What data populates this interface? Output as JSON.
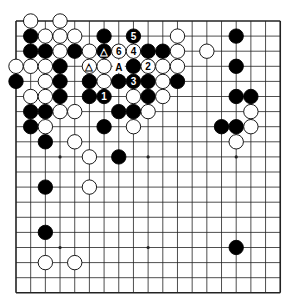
{
  "diagram": {
    "type": "go-board",
    "size": 19,
    "visible_rows": 19,
    "geometry": {
      "left": 16,
      "top": 21,
      "dx": 14.68,
      "dy": 15.1,
      "stone_radius": 7.2
    },
    "colors": {
      "line": "#222222",
      "black": "#000000",
      "white": "#ffffff",
      "background": "#ffffff"
    },
    "hoshi": [
      [
        3,
        3
      ],
      [
        9,
        3
      ],
      [
        15,
        3
      ],
      [
        3,
        9
      ],
      [
        9,
        9
      ],
      [
        15,
        9
      ],
      [
        3,
        15
      ],
      [
        9,
        15
      ],
      [
        15,
        15
      ]
    ],
    "stones": [
      {
        "c": 1,
        "r": 0,
        "color": "white"
      },
      {
        "c": 3,
        "r": 0,
        "color": "white"
      },
      {
        "c": 1,
        "r": 1,
        "color": "black"
      },
      {
        "c": 2,
        "r": 1,
        "color": "white"
      },
      {
        "c": 3,
        "r": 1,
        "color": "white"
      },
      {
        "c": 4,
        "r": 1,
        "color": "white"
      },
      {
        "c": 6,
        "r": 1,
        "color": "black"
      },
      {
        "c": 8,
        "r": 1,
        "color": "black",
        "label": "5"
      },
      {
        "c": 11,
        "r": 1,
        "color": "white"
      },
      {
        "c": 15,
        "r": 1,
        "color": "black"
      },
      {
        "c": 1,
        "r": 2,
        "color": "black"
      },
      {
        "c": 2,
        "r": 2,
        "color": "black"
      },
      {
        "c": 3,
        "r": 2,
        "color": "white"
      },
      {
        "c": 4,
        "r": 2,
        "color": "black"
      },
      {
        "c": 5,
        "r": 2,
        "color": "white"
      },
      {
        "c": 6,
        "r": 2,
        "color": "black",
        "label": "△"
      },
      {
        "c": 7,
        "r": 2,
        "color": "white",
        "label": "6"
      },
      {
        "c": 8,
        "r": 2,
        "color": "white",
        "label": "4"
      },
      {
        "c": 9,
        "r": 2,
        "color": "black"
      },
      {
        "c": 10,
        "r": 2,
        "color": "black"
      },
      {
        "c": 11,
        "r": 2,
        "color": "white"
      },
      {
        "c": 13,
        "r": 2,
        "color": "white"
      },
      {
        "c": 0,
        "r": 3,
        "color": "white"
      },
      {
        "c": 1,
        "r": 3,
        "color": "white"
      },
      {
        "c": 2,
        "r": 3,
        "color": "white"
      },
      {
        "c": 3,
        "r": 3,
        "color": "black"
      },
      {
        "c": 5,
        "r": 3,
        "color": "white",
        "label": "△"
      },
      {
        "c": 6,
        "r": 3,
        "color": "white"
      },
      {
        "c": 8,
        "r": 3,
        "color": "black"
      },
      {
        "c": 9,
        "r": 3,
        "color": "white",
        "label": "2"
      },
      {
        "c": 10,
        "r": 3,
        "color": "white"
      },
      {
        "c": 11,
        "r": 3,
        "color": "white"
      },
      {
        "c": 15,
        "r": 3,
        "color": "black"
      },
      {
        "c": 0,
        "r": 4,
        "color": "black"
      },
      {
        "c": 2,
        "r": 4,
        "color": "white"
      },
      {
        "c": 3,
        "r": 4,
        "color": "black"
      },
      {
        "c": 5,
        "r": 4,
        "color": "black"
      },
      {
        "c": 6,
        "r": 4,
        "color": "white"
      },
      {
        "c": 7,
        "r": 4,
        "color": "black"
      },
      {
        "c": 8,
        "r": 4,
        "color": "black",
        "label": "3"
      },
      {
        "c": 9,
        "r": 4,
        "color": "black"
      },
      {
        "c": 10,
        "r": 4,
        "color": "white"
      },
      {
        "c": 11,
        "r": 4,
        "color": "black"
      },
      {
        "c": 1,
        "r": 5,
        "color": "white"
      },
      {
        "c": 2,
        "r": 5,
        "color": "white"
      },
      {
        "c": 3,
        "r": 5,
        "color": "black"
      },
      {
        "c": 5,
        "r": 5,
        "color": "black"
      },
      {
        "c": 6,
        "r": 5,
        "color": "black",
        "label": "1"
      },
      {
        "c": 8,
        "r": 5,
        "color": "white"
      },
      {
        "c": 9,
        "r": 5,
        "color": "black"
      },
      {
        "c": 10,
        "r": 5,
        "color": "white"
      },
      {
        "c": 15,
        "r": 5,
        "color": "black"
      },
      {
        "c": 16,
        "r": 5,
        "color": "black"
      },
      {
        "c": 1,
        "r": 6,
        "color": "black"
      },
      {
        "c": 2,
        "r": 6,
        "color": "black"
      },
      {
        "c": 3,
        "r": 6,
        "color": "white"
      },
      {
        "c": 4,
        "r": 6,
        "color": "white"
      },
      {
        "c": 7,
        "r": 6,
        "color": "black"
      },
      {
        "c": 8,
        "r": 6,
        "color": "black"
      },
      {
        "c": 9,
        "r": 6,
        "color": "white"
      },
      {
        "c": 16,
        "r": 6,
        "color": "white"
      },
      {
        "c": 1,
        "r": 7,
        "color": "black"
      },
      {
        "c": 2,
        "r": 7,
        "color": "white"
      },
      {
        "c": 6,
        "r": 7,
        "color": "black"
      },
      {
        "c": 8,
        "r": 7,
        "color": "white"
      },
      {
        "c": 14,
        "r": 7,
        "color": "black"
      },
      {
        "c": 15,
        "r": 7,
        "color": "black"
      },
      {
        "c": 16,
        "r": 7,
        "color": "white"
      },
      {
        "c": 2,
        "r": 8,
        "color": "black"
      },
      {
        "c": 4,
        "r": 8,
        "color": "white"
      },
      {
        "c": 15,
        "r": 8,
        "color": "white"
      },
      {
        "c": 5,
        "r": 9,
        "color": "white"
      },
      {
        "c": 7,
        "r": 9,
        "color": "black"
      },
      {
        "c": 2,
        "r": 11,
        "color": "black"
      },
      {
        "c": 5,
        "r": 11,
        "color": "white"
      },
      {
        "c": 2,
        "r": 14,
        "color": "black"
      },
      {
        "c": 15,
        "r": 15,
        "color": "black"
      },
      {
        "c": 2,
        "r": 16,
        "color": "white"
      },
      {
        "c": 4,
        "r": 16,
        "color": "white"
      }
    ],
    "point_labels": [
      {
        "c": 7,
        "r": 3,
        "label": "A"
      }
    ]
  }
}
